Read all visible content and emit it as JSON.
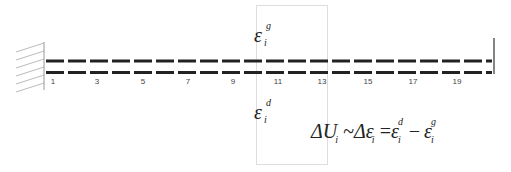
{
  "diagram": {
    "type": "cantilever-beam-strain-diagram",
    "colors": {
      "beam": "#222222",
      "wall": "#999999",
      "highlight_box": "#dddddd",
      "text": "#222222",
      "node_label": "#444444"
    },
    "node_labels": [
      "1",
      "3",
      "5",
      "7",
      "9",
      "11",
      "13",
      "15",
      "17",
      "19"
    ],
    "node_x": [
      53,
      97,
      143,
      188,
      233,
      278,
      322,
      368,
      413,
      457
    ],
    "upper_label": {
      "symbol": "ε",
      "subscript": "i",
      "superscript": "g"
    },
    "lower_label": {
      "symbol": "ε",
      "subscript": "i",
      "superscript": "d"
    },
    "equation": {
      "lhs": "ΔU",
      "lhs_sub": "i",
      "tilde": "~",
      "mid": "Δε",
      "mid_sub": "i",
      "equals": "=",
      "term1": "ε",
      "term1_sub": "i",
      "term1_sup": "d",
      "minus": "−",
      "term2": "ε",
      "term2_sub": "i",
      "term2_sup": "g"
    }
  }
}
